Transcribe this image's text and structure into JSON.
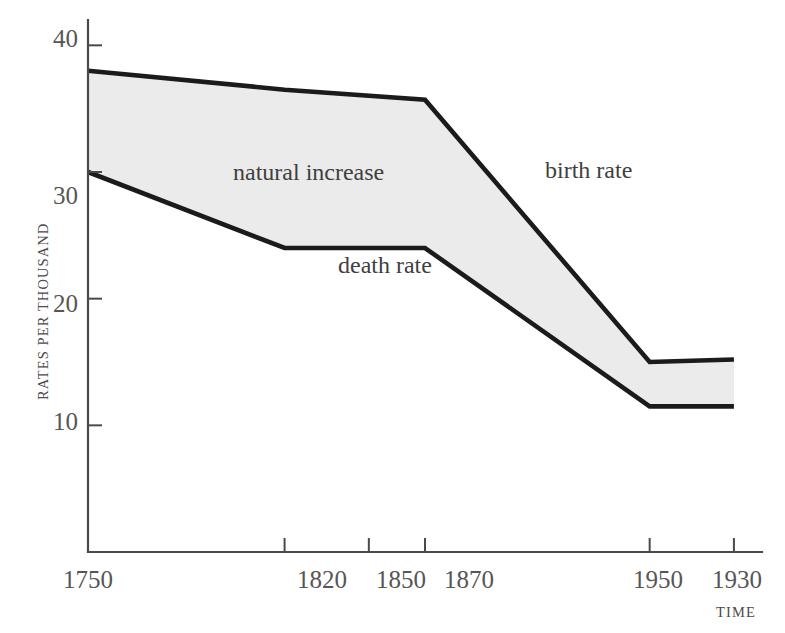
{
  "chart_data": {
    "type": "area",
    "title": "",
    "subtitle": "",
    "xlabel": "TIME",
    "ylabel": "RATES PER THOUSAND",
    "x_tick_labels": [
      "1750",
      "1820",
      "1850",
      "1870",
      "1950",
      "1930"
    ],
    "x_tick_positions": [
      1750,
      1820,
      1850,
      1870,
      1950,
      1980
    ],
    "y_tick_labels": [
      "10",
      "20",
      "30",
      "40"
    ],
    "y_ticks": [
      10,
      20,
      30,
      40
    ],
    "ylim": [
      0,
      42
    ],
    "xlim": [
      1750,
      1990
    ],
    "grid": false,
    "legend_position": "inline-annotations",
    "fill_color": "#ebebeb",
    "line_color": "#1b1b1b",
    "axis_color": "#4a4a4a",
    "series": [
      {
        "name": "birth rate",
        "x": [
          1750,
          1820,
          1870,
          1950,
          1980
        ],
        "values": [
          38.0,
          36.5,
          35.7,
          15.0,
          15.2
        ]
      },
      {
        "name": "death rate",
        "x": [
          1750,
          1820,
          1870,
          1950,
          1980
        ],
        "values": [
          30.0,
          24.0,
          24.0,
          11.5,
          11.5
        ]
      }
    ],
    "annotations": [
      {
        "text": "natural increase",
        "x": 1818,
        "y": 31.2
      },
      {
        "text": "birth rate",
        "x": 1905,
        "y": 31.5
      },
      {
        "text": "death rate",
        "x": 1838,
        "y": 21.2
      }
    ]
  },
  "axes": {
    "y_title": "RATES PER THOUSAND",
    "x_title": "TIME"
  },
  "labels": {
    "natural_increase": "natural increase",
    "birth_rate": "birth rate",
    "death_rate": "death rate"
  },
  "x_ticks": [
    {
      "label": "1750"
    },
    {
      "label": "1820"
    },
    {
      "label": "1850"
    },
    {
      "label": "1870"
    },
    {
      "label": "1950"
    },
    {
      "label": "1930"
    }
  ],
  "y_ticks": [
    {
      "label": "40"
    },
    {
      "label": "30"
    },
    {
      "label": "20"
    },
    {
      "label": "10"
    }
  ]
}
